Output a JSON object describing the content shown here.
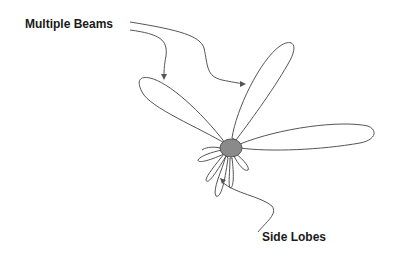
{
  "diagram": {
    "labels": {
      "multiple_beams": "Multiple Beams",
      "side_lobes": "Side Lobes"
    },
    "colors": {
      "outline": "#555555",
      "hub_fill": "#8a8a8a",
      "text": "#1a1a1a",
      "background": "#ffffff"
    },
    "main_beams": [
      {
        "name": "upper-left-beam"
      },
      {
        "name": "upper-beam"
      },
      {
        "name": "right-beam"
      }
    ],
    "side_lobe_count": 5
  }
}
